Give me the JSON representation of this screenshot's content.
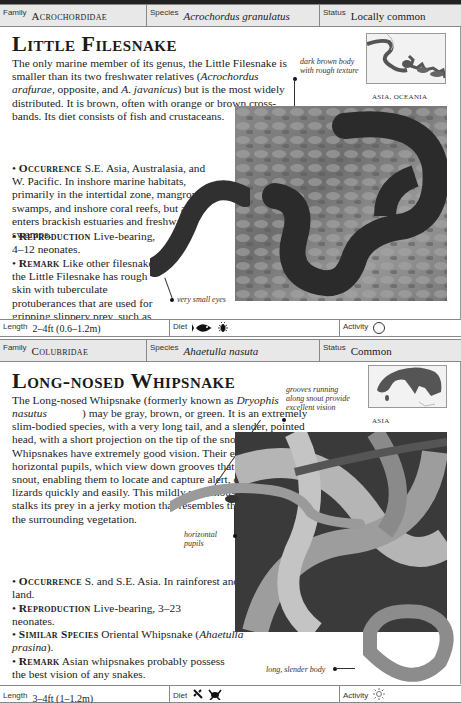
{
  "entries": [
    {
      "family_label": "Family",
      "family": "Acrochordidae",
      "species_label": "Species",
      "species": "Acrochordus granulatus",
      "status_label": "Status",
      "status": "Locally common",
      "title": "Little Filesnake",
      "intro_1": "The only marine member of its genus, the Little Filesnake is smaller than its two freshwater relatives (",
      "intro_ital_1": "Acrochordus arafurae",
      "intro_2": ", opposite, and ",
      "intro_ital_2": "A. javanicus",
      "intro_3": ") but is the most widely distributed. It is brown, often with orange or brown cross-bands. Its diet consists of fish and crustaceans.",
      "occurrence_kw": "Occurrence",
      "occurrence": "S.E. Asia, Australasia, and W. Pacific. In inshore marine habitats, primarily in the intertidal zone, mangrove swamps, and inshore coral reefs, but also enters brackish estuaries and freshwater swamps.",
      "reproduction_kw": "Reproduction",
      "reproduction": "Live-bearing, 4–12 neonates.",
      "remark_kw": "Remark",
      "remark": "Like other filesnakes, the Little Filesnake has rough skin with tuberculate protuberances that are used for gripping slippery prey, such as fish, in the water.",
      "map_caption": "ASIA, OCEANIA",
      "annotations": [
        "dark brown body with rough texture",
        "very small eyes"
      ],
      "length_label": "Length",
      "length": "2–4ft (0.6–1.2m)",
      "diet_label": "Diet",
      "diet_icons": [
        "fish-icon",
        "insect-icon"
      ],
      "activity_label": "Activity",
      "activity_icon": "circle-icon"
    },
    {
      "family_label": "Family",
      "family": "Colubridae",
      "species_label": "Species",
      "species": "Ahaetulla nasuta",
      "status_label": "Status",
      "status": "Common",
      "title": "Long-nosed Whipsnake",
      "intro_1": "The Long-nosed Whipsnake (formerly known as ",
      "intro_ital_1": "Dryophis nasutus",
      "intro_2": ") may be gray, brown, or green. It is an extremely slim-bodied species, with a very long tail, and a slender, pointed head, with a short projection on the tip of the snout. Long-nosed Whipsnakes have extremely good vision. Their eyes have horizontal pupils, which view down grooves that run along the snout, enabling them to locate and capture alert, camouflaged lizards quickly and easily. This mildly venomous whipsnake stalks its prey in a jerky motion that resembles the movement of the surrounding vegetation.",
      "occurrence_kw": "Occurrence",
      "occurrence": "S. and S.E. Asia. In rainforest and on cultivated land.",
      "reproduction_kw": "Reproduction",
      "reproduction": "Live-bearing, 3–23 neonates.",
      "similar_kw": "Similar Species",
      "similar_1": "Oriental Whipsnake (",
      "similar_ital": "Ahaetulla prasina",
      "similar_2": ").",
      "remark_kw": "Remark",
      "remark": "Asian whipsnakes probably possess the best vision of any snakes.",
      "map_caption": "ASIA",
      "annotations": [
        "grooves running along snout provide excellent vision",
        "horizontal pupils",
        "long, slender body"
      ],
      "length_label": "Length",
      "length": "3–4ft (1–1.2m)",
      "diet_label": "Diet",
      "diet_icons": [
        "lizard-icon",
        "frog-icon"
      ],
      "activity_label": "Activity",
      "activity_icon": "sun-icon"
    }
  ]
}
